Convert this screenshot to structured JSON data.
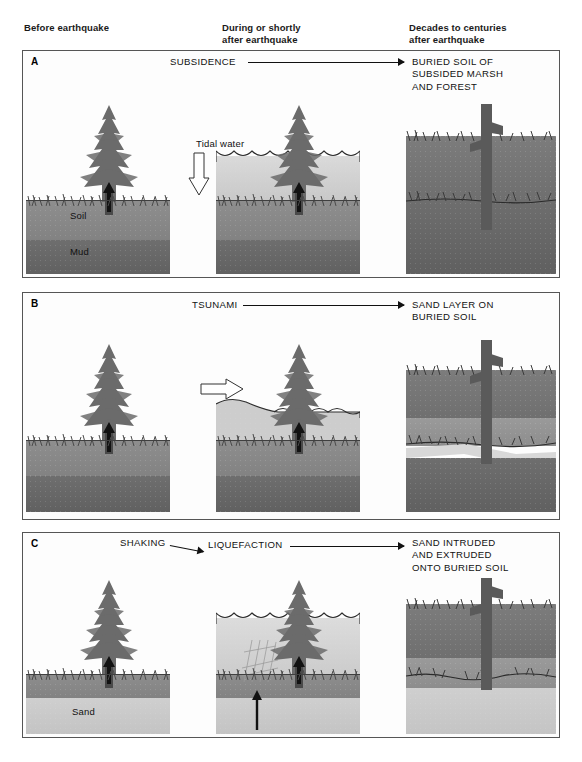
{
  "headers": {
    "col1": "Before earthquake",
    "col2": "During or shortly\nafter earthquake",
    "col3": "Decades to centuries\nafter earthquake"
  },
  "panels": [
    {
      "letter": "A",
      "process_label": "SUBSIDENCE",
      "outcome_label": "BURIED SOIL OF\nSUBSIDED MARSH\nAND FOREST",
      "terrain_labels": [
        "Soil",
        "Mud"
      ],
      "scene_labels": [
        "Tidal water"
      ],
      "icons": [
        "down-block-arrow",
        "tree-upward-arrow"
      ]
    },
    {
      "letter": "B",
      "process_label": "TSUNAMI",
      "outcome_label": "SAND LAYER ON\nBURIED SOIL",
      "terrain_labels": [],
      "scene_labels": [],
      "icons": [
        "right-block-arrow",
        "tree-upward-arrow"
      ]
    },
    {
      "letter": "C",
      "process_label_1": "SHAKING",
      "process_label_2": "LIQUEFACTION",
      "outcome_label": "SAND INTRUDED\nAND EXTRUDED\nONTO BURIED SOIL",
      "terrain_labels": [
        "Sand"
      ],
      "scene_labels": [],
      "icons": [
        "up-black-arrow",
        "tree-upward-arrow"
      ]
    }
  ],
  "colors": {
    "soil": "#8e8e8e",
    "mud": "#6e6e6e",
    "sand": "#cfcfcf",
    "water": "#dadada",
    "tree": "#6b6b6b",
    "border": "#555555",
    "text": "#111111"
  }
}
